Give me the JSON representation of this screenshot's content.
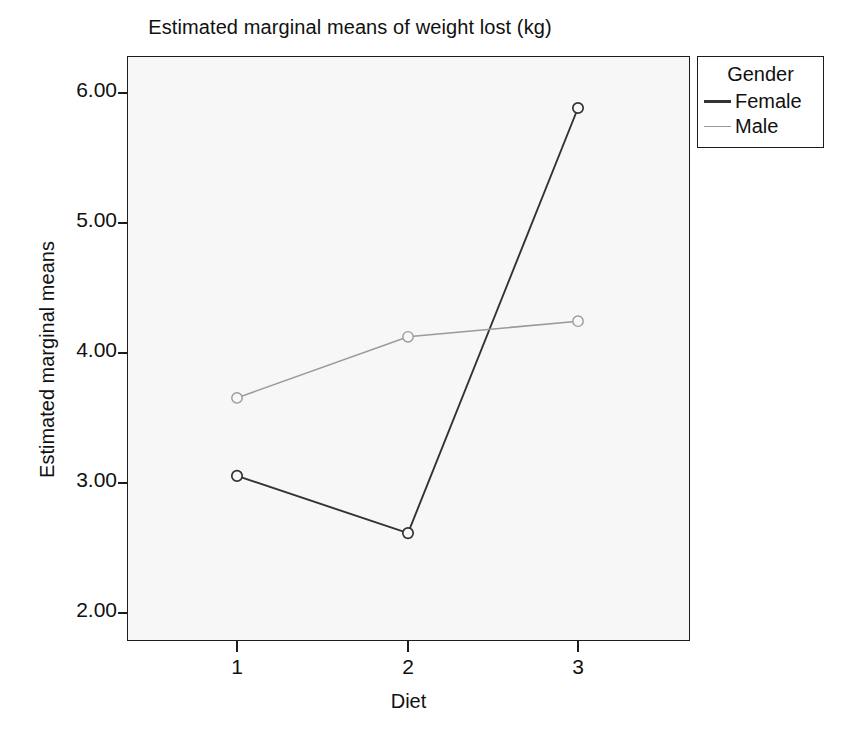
{
  "chart_data": {
    "type": "line",
    "title": "Estimated marginal means of weight lost (kg)",
    "xlabel": "Diet",
    "ylabel": "Estimated marginal means",
    "categories": [
      "1",
      "2",
      "3"
    ],
    "x_tick_labels": [
      "1",
      "2",
      "3"
    ],
    "y_tick_labels": [
      "2.00",
      "3.00",
      "4.00",
      "5.00",
      "6.00"
    ],
    "y_tick_values": [
      2.0,
      3.0,
      4.0,
      5.0,
      6.0
    ],
    "ylim": [
      1.78,
      6.28
    ],
    "grid": false,
    "legend_title": "Gender",
    "legend_position": "right-top",
    "marker": "open-circle",
    "plot_background": "#f7f7f7",
    "series": [
      {
        "name": "Female",
        "color": "#333333",
        "values": [
          3.05,
          2.61,
          5.88
        ]
      },
      {
        "name": "Male",
        "color": "#9a9a9a",
        "values": [
          3.65,
          4.12,
          4.24
        ]
      }
    ]
  },
  "legend": {
    "title": "Gender",
    "entries": [
      {
        "label": "Female",
        "color": "#333333"
      },
      {
        "label": "Male",
        "color": "#9a9a9a"
      }
    ]
  }
}
